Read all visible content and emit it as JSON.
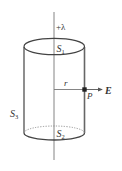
{
  "diagram": {
    "labels": {
      "line_charge": "+λ",
      "top_surface": "S",
      "top_surface_sub": "1",
      "bottom_surface": "S",
      "bottom_surface_sub": "2",
      "side_surface": "S",
      "side_surface_sub": "3",
      "radius": "r",
      "point": "P",
      "field": "E"
    },
    "colors": {
      "stroke": "#444444",
      "axis": "#666666",
      "text": "#333333",
      "point": "#222222"
    }
  }
}
